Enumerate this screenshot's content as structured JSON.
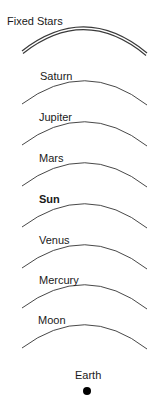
{
  "diagram": {
    "spheres": [
      {
        "label": "Fixed Stars",
        "bold": false,
        "double_line": true
      },
      {
        "label": "Saturn",
        "bold": false,
        "double_line": false
      },
      {
        "label": "Jupiter",
        "bold": false,
        "double_line": false
      },
      {
        "label": "Mars",
        "bold": false,
        "double_line": false
      },
      {
        "label": "Sun",
        "bold": true,
        "double_line": false
      },
      {
        "label": "Venus",
        "bold": false,
        "double_line": false
      },
      {
        "label": "Mercury",
        "bold": false,
        "double_line": false
      },
      {
        "label": "Moon",
        "bold": false,
        "double_line": false
      }
    ],
    "center": {
      "label": "Earth",
      "marker": "filled-circle"
    },
    "colors": {
      "line": "#333333",
      "text": "#1a1a1a",
      "earth": "#000000"
    }
  }
}
